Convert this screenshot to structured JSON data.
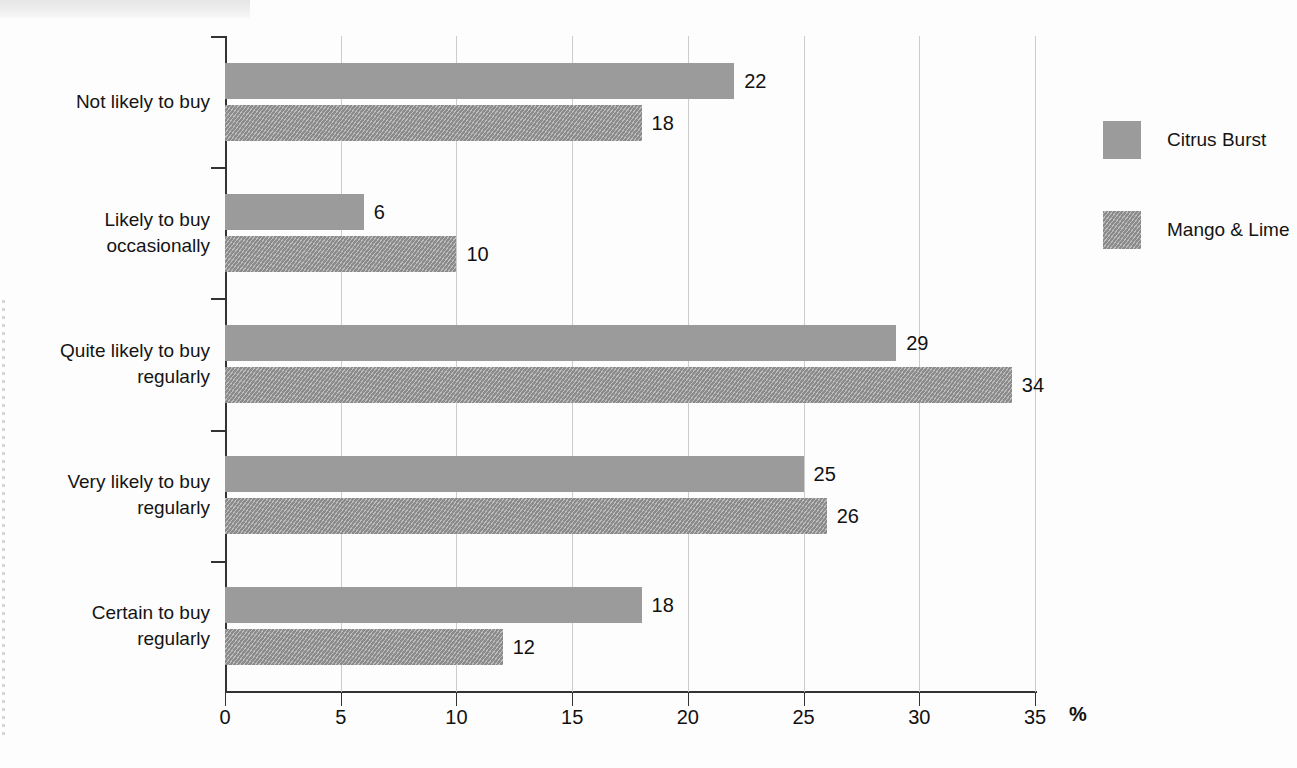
{
  "chart_data": {
    "type": "bar",
    "orientation": "horizontal",
    "title": "",
    "xlabel": "%",
    "ylabel": "",
    "xlim": [
      0,
      35
    ],
    "xticks": [
      0,
      5,
      10,
      15,
      20,
      25,
      30,
      35
    ],
    "grid": true,
    "legend_position": "right",
    "categories": [
      "Not likely to buy",
      "Likely to buy occasionally",
      "Quite likely to buy regularly",
      "Very likely to buy regularly",
      "Certain to buy regularly"
    ],
    "category_lines": [
      [
        "Not likely to buy"
      ],
      [
        "Likely to buy",
        "occasionally"
      ],
      [
        "Quite likely to buy",
        "regularly"
      ],
      [
        "Very likely to buy",
        "regularly"
      ],
      [
        "Certain to buy",
        "regularly"
      ]
    ],
    "series": [
      {
        "name": "Citrus Burst",
        "color": "#9b9b9b",
        "pattern": "solid",
        "values": [
          22,
          6,
          29,
          25,
          18
        ]
      },
      {
        "name": "Mango & Lime",
        "color": "#9b9b9b",
        "pattern": "hatched",
        "values": [
          18,
          10,
          34,
          26,
          12
        ]
      }
    ]
  },
  "legend": {
    "items": [
      {
        "label": "Citrus Burst"
      },
      {
        "label": "Mango & Lime"
      }
    ]
  },
  "axis": {
    "percent_symbol": "%"
  }
}
